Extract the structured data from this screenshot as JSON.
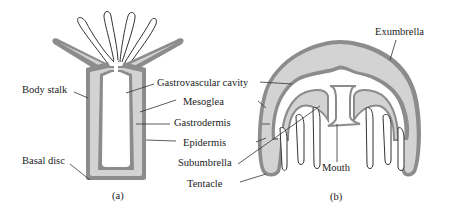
{
  "diagram": {
    "colors": {
      "epidermis": "#8c8c8c",
      "mesoglea": "#d3d3d3",
      "gastrodermis": "#8c8c8c",
      "cavity": "#ffffff",
      "line": "#333333"
    },
    "panel_a": {
      "caption": "(a)",
      "labels": {
        "body_stalk": "Body stalk",
        "basal_disc": "Basal disc"
      }
    },
    "panel_b": {
      "caption": "(b)",
      "labels": {
        "exumbrella": "Exumbrella",
        "mouth": "Mouth"
      }
    },
    "shared_labels": {
      "gastrovascular_cavity": "Gastrovascular cavity",
      "mesoglea": "Mesoglea",
      "gastrodermis": "Gastrodermis",
      "epidermis": "Epidermis",
      "subumbrella": "Subumbrella",
      "tentacle": "Tentacle"
    }
  }
}
